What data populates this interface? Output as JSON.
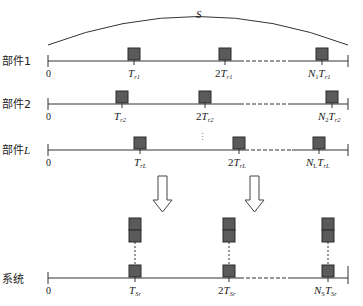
{
  "diagram": {
    "arc_label": "S",
    "colors": {
      "box_fill": "#5a5a5a",
      "box_stroke": "#2a2a2a",
      "line": "#333333"
    },
    "components": [
      {
        "label": "部件1",
        "zero": "0",
        "ticks": [
          {
            "main": "T",
            "sub": "r1",
            "prefix": ""
          },
          {
            "main": "T",
            "sub": "r1",
            "prefix": "2"
          },
          {
            "main": "T",
            "sub": "r1",
            "prefix": "N",
            "prefix_sub": "1"
          }
        ]
      },
      {
        "label": "部件2",
        "zero": "0",
        "ticks": [
          {
            "main": "T",
            "sub": "r2",
            "prefix": ""
          },
          {
            "main": "T",
            "sub": "r2",
            "prefix": "2"
          },
          {
            "main": "T",
            "sub": "r2",
            "prefix": "N",
            "prefix_sub": "2"
          }
        ]
      },
      {
        "label": "部件",
        "label_var": "L",
        "zero": "0",
        "ticks": [
          {
            "main": "T",
            "sub": "rL",
            "prefix": ""
          },
          {
            "main": "T",
            "sub": "rL",
            "prefix": "2"
          },
          {
            "main": "T",
            "sub": "rL",
            "prefix": "N",
            "prefix_sub": "L"
          }
        ]
      }
    ],
    "ellipsis": "⋮",
    "system": {
      "label": "系统",
      "zero": "0",
      "ticks": [
        {
          "main": "T",
          "sub": "Sr",
          "prefix": ""
        },
        {
          "main": "T",
          "sub": "Sr",
          "prefix": "2"
        },
        {
          "main": "T",
          "sub": "Sr",
          "prefix": "N",
          "prefix_sub": "S"
        }
      ]
    }
  }
}
